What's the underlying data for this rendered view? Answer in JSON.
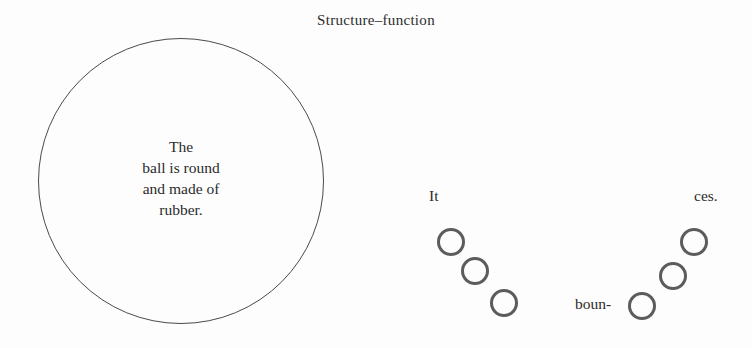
{
  "figure": {
    "title": "Structure–function",
    "background_color": "#fdfdfd",
    "ink_color": "#2b2b2b"
  },
  "structure": {
    "shape": "large-circle",
    "stroke_color": "#4a4a4a",
    "text_lines": [
      "The",
      "ball is round",
      "and made of",
      "rubber."
    ]
  },
  "function": {
    "stroke_color": "#5c5c5c",
    "captions": {
      "it": "It",
      "boun": "boun-",
      "ces": "ces."
    },
    "bounce_balls": [
      {
        "id": "d1",
        "group": "descending"
      },
      {
        "id": "d2",
        "group": "descending"
      },
      {
        "id": "d3",
        "group": "descending"
      },
      {
        "id": "a1",
        "group": "ascending"
      },
      {
        "id": "a2",
        "group": "ascending"
      },
      {
        "id": "a3",
        "group": "ascending"
      }
    ]
  }
}
